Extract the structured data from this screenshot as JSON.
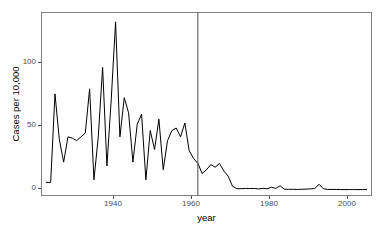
{
  "chart_data": {
    "type": "line",
    "title": "",
    "xlabel": "year",
    "ylabel": "Cases per 10,000",
    "xlim": [
      1927,
      2003
    ],
    "ylim": [
      -4,
      140
    ],
    "grid": false,
    "legend": "none",
    "x_ticks": [
      1940,
      1960,
      1980,
      2000
    ],
    "x_tick_labels": [
      "1940",
      "1960",
      "1980",
      "2000"
    ],
    "y_ticks": [
      0,
      50,
      100
    ],
    "y_tick_labels": [
      "0",
      "50",
      "100"
    ],
    "line_color": "#000000",
    "panel_border_color": "#7f7f7f",
    "background_color": "#ffffff",
    "annotations": [
      {
        "name": "vaccine-introduction-line",
        "type": "vertical-line",
        "x": 1963,
        "color": "#4d4d4d"
      }
    ],
    "x": [
      1928,
      1929,
      1930,
      1931,
      1932,
      1933,
      1934,
      1935,
      1936,
      1937,
      1938,
      1939,
      1940,
      1941,
      1942,
      1943,
      1944,
      1945,
      1946,
      1947,
      1948,
      1949,
      1950,
      1951,
      1952,
      1953,
      1954,
      1955,
      1956,
      1957,
      1958,
      1959,
      1960,
      1961,
      1962,
      1963,
      1964,
      1965,
      1966,
      1967,
      1968,
      1969,
      1970,
      1971,
      1972,
      1973,
      1974,
      1975,
      1976,
      1977,
      1978,
      1979,
      1980,
      1981,
      1982,
      1983,
      1984,
      1985,
      1986,
      1987,
      1988,
      1989,
      1990,
      1991,
      1992,
      1993,
      1994,
      1995,
      1996,
      1997,
      1998,
      1999,
      2000,
      2001,
      2002
    ],
    "values": [
      6,
      6,
      76,
      40,
      22,
      42,
      41,
      39,
      42,
      45,
      80,
      8,
      42,
      97,
      19,
      72,
      133,
      42,
      73,
      61,
      22,
      52,
      60,
      8,
      47,
      32,
      56,
      16,
      39,
      47,
      49,
      42,
      53,
      31,
      25,
      21,
      13,
      16,
      20,
      18,
      21,
      15,
      11,
      3,
      1,
      1,
      1.2,
      1.1,
      1.2,
      0.8,
      1.3,
      0.9,
      2.2,
      1.2,
      3.3,
      0.6,
      0.5,
      0.5,
      0.4,
      0.5,
      0.7,
      0.8,
      1.1,
      4.5,
      1.0,
      0.4,
      0.4,
      0.4,
      0.3,
      0.3,
      0.3,
      0.3,
      0.3,
      0.3,
      0.3
    ]
  },
  "axes": {
    "y_label": "Cases per 10,000",
    "x_label": "year",
    "y_tick_0": "0",
    "y_tick_50": "50",
    "y_tick_100": "100",
    "x_tick_1940": "1940",
    "x_tick_1960": "1960",
    "x_tick_1980": "1980",
    "x_tick_2000": "2000"
  }
}
